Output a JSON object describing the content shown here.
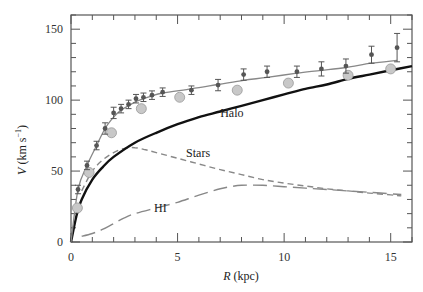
{
  "chart_data": {
    "type": "scatter",
    "title": "",
    "xlabel_italic": "R",
    "xlabel_rest": " (kpc)",
    "ylabel_italic": "V",
    "ylabel_rest": " (km s",
    "ylabel_sup": "−1",
    "ylabel_close": ")",
    "xlim": [
      0,
      16
    ],
    "ylim": [
      0,
      160
    ],
    "grid": false,
    "x_ticks_major": [
      0,
      5,
      10,
      15
    ],
    "x_ticks_minor_step": 1,
    "y_ticks_major": [
      0,
      50,
      100,
      150
    ],
    "y_ticks_minor_step": 10,
    "series": [
      {
        "name": "Observed (error bars)",
        "style": "dark-points-with-errorbars",
        "color": "#555555",
        "x": [
          0.33,
          0.75,
          1.2,
          1.6,
          2.0,
          2.35,
          2.7,
          3.05,
          3.4,
          3.8,
          4.3,
          5.65,
          6.9,
          8.1,
          9.2,
          10.6,
          11.75,
          12.9,
          14.1,
          15.3
        ],
        "y": [
          37,
          54,
          68,
          80,
          91,
          94,
          97,
          101,
          102,
          103.5,
          105.6,
          107,
          110.6,
          118,
          120,
          120,
          122,
          124,
          132,
          137
        ],
        "err": [
          3,
          3,
          3,
          4,
          4,
          3,
          3,
          3,
          3,
          3,
          3,
          3,
          4,
          4,
          4,
          4,
          5,
          5,
          6,
          10
        ]
      },
      {
        "name": "Model fit",
        "style": "thin-grey-line",
        "color": "#888888",
        "x": [
          0,
          0.33,
          0.75,
          1.2,
          1.6,
          2.0,
          2.35,
          2.7,
          3.05,
          3.4,
          3.8,
          4.3,
          5.65,
          6.9,
          8.1,
          9.2,
          10.6,
          11.75,
          12.9,
          14.1,
          15.3
        ],
        "y": [
          0,
          37,
          54,
          68,
          80,
          88,
          93,
          96,
          99,
          101,
          103,
          105,
          108,
          111,
          114,
          116,
          119,
          121,
          123,
          126,
          128
        ]
      },
      {
        "name": "Grey circles",
        "style": "grey-filled-circles",
        "color": "#c8c8c8",
        "x": [
          0.3,
          0.85,
          1.9,
          3.3,
          5.1,
          7.8,
          10.2,
          13.0,
          15.0
        ],
        "y": [
          24,
          49,
          77,
          94,
          102,
          107,
          112,
          117.5,
          122
        ]
      },
      {
        "name": "Halo",
        "style": "thick-black-line",
        "color": "#111111",
        "x": [
          0,
          0.25,
          0.5,
          1,
          1.5,
          2,
          3,
          4,
          5,
          6,
          7,
          8,
          9,
          10,
          11,
          12,
          13,
          14,
          15,
          16
        ],
        "y": [
          0,
          18,
          30,
          44,
          53,
          60,
          70,
          77,
          83,
          88,
          92,
          96,
          100,
          104,
          108,
          111,
          115,
          118,
          121,
          124
        ]
      },
      {
        "name": "Stars",
        "style": "short-dashed-grey",
        "color": "#888888",
        "x": [
          0.5,
          1,
          1.5,
          2,
          2.5,
          3,
          3.5,
          4,
          5,
          6,
          7,
          8,
          9,
          10,
          11,
          12,
          13,
          14,
          15,
          15.5
        ],
        "y": [
          36,
          50,
          58,
          63,
          66,
          66.5,
          65,
          63,
          59,
          55,
          51,
          47.5,
          44,
          41.5,
          39.5,
          37.5,
          36,
          34.5,
          33.2,
          32.5
        ]
      },
      {
        "name": "HI",
        "style": "long-dashed-grey",
        "color": "#888888",
        "x": [
          0.5,
          1,
          1.5,
          2,
          2.5,
          3,
          4,
          5,
          6,
          7,
          7.5,
          8,
          9,
          10,
          11,
          12,
          13,
          14,
          15,
          15.5
        ],
        "y": [
          4,
          6,
          9,
          13,
          17,
          20,
          24,
          28,
          33,
          37.5,
          39,
          40,
          40,
          39,
          38,
          37,
          36,
          35,
          34,
          33.5
        ]
      }
    ],
    "annotations": [
      {
        "text": "Halo",
        "x": 7.0,
        "y": 88
      },
      {
        "text": "Stars",
        "x": 5.4,
        "y": 60
      },
      {
        "text": "HI",
        "x": 3.9,
        "y": 21
      }
    ]
  }
}
